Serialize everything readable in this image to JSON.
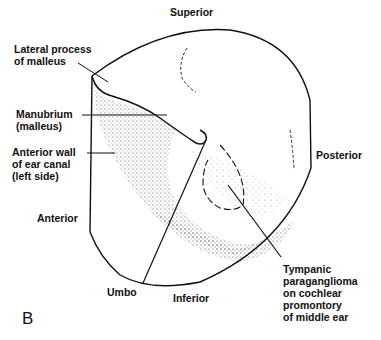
{
  "figure": {
    "panel_letter": "B",
    "orientation": {
      "superior": "Superior",
      "inferior": "Inferior",
      "anterior": "Anterior",
      "posterior": "Posterior"
    },
    "labels": {
      "lateral_process": "Lateral process\nof malleus",
      "manubrium": "Manubrium\n(malleus)",
      "anterior_wall": "Anterior wall\nof ear canal\n(left side)",
      "umbo": "Umbo",
      "tumor": "Tympanic\nparaganglioma\non cochlear\npromontory\nof middle ear"
    },
    "colors": {
      "ink": "#111111",
      "background": "#ffffff"
    }
  }
}
